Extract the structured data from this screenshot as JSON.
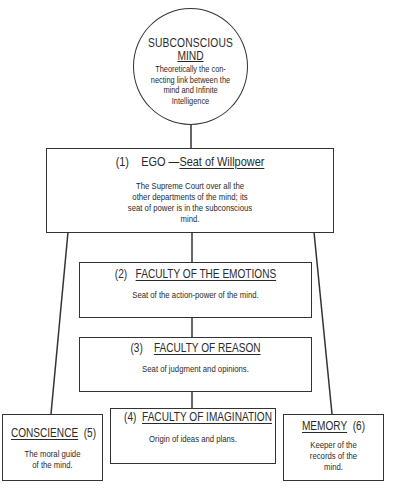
{
  "diagram": {
    "subconscious": {
      "title_line1": "SUBCONSCIOUS",
      "title_line2": "MIND",
      "description": "Theoretically the con-necting link between the mind and Infinite Intelligence"
    },
    "ego": {
      "number": "(1)",
      "name": "EGO",
      "dash": "—",
      "subtitle": "Seat of Willpower",
      "description": "The Supreme Court over all the other departments of the mind; its seat of power is in the subconscious mind."
    },
    "emotions": {
      "number": "(2)",
      "title": "FACULTY OF THE EMOTIONS",
      "description": "Seat of the action-power of the mind."
    },
    "reason": {
      "number": "(3)",
      "title": "FACULTY OF REASON",
      "description": "Seat of judgment and opinions."
    },
    "imagination": {
      "number": "(4)",
      "title": "FACULTY OF IMAGINATION",
      "description": "Origin of ideas and plans."
    },
    "conscience": {
      "number": "(5)",
      "title": "CONSCIENCE",
      "description_line1": "The moral guide",
      "description_line2": "of the mind."
    },
    "memory": {
      "number": "(6)",
      "title": "MEMORY",
      "description_line1": "Keeper of the",
      "description_line2": "records of the",
      "description_line3": "mind."
    }
  },
  "colors": {
    "line": "#333333",
    "text": "#2a2a2a",
    "background": "#ffffff"
  }
}
